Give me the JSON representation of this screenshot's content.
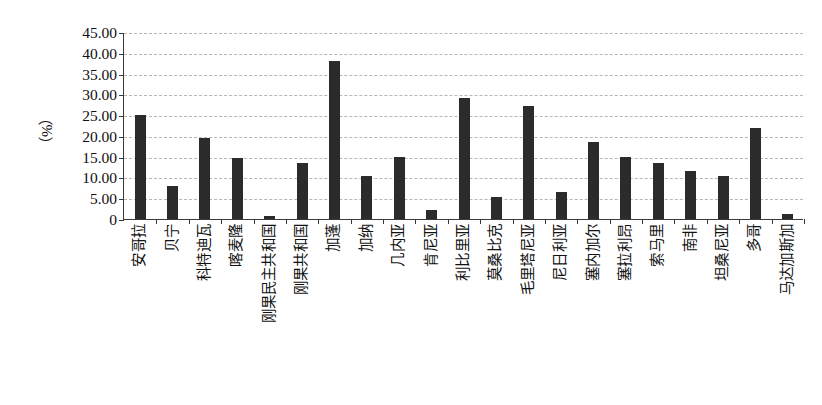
{
  "chart_data": {
    "type": "bar",
    "title": "",
    "subtitle": "",
    "xlabel": "",
    "ylabel": "（%）",
    "ylim": [
      0,
      45
    ],
    "ytick_values": [
      45,
      40,
      35,
      30,
      25,
      20,
      15,
      10,
      5,
      0
    ],
    "ytick_labels": [
      "45.00",
      "40.00",
      "35.00",
      "30.00",
      "25.00",
      "20.00",
      "15.00",
      "10.00",
      "5.00",
      "0"
    ],
    "grid": true,
    "grid_axis": "y",
    "grid_style": "dashed",
    "legend": false,
    "legend_position": "none",
    "bar_color": "#2b2b2b",
    "axis_color": "#3a3a3a",
    "gridline_color": "#b6b6b6",
    "background_color": "#ffffff",
    "categories": [
      "安哥拉",
      "贝宁",
      "科特迪瓦",
      "喀麦隆",
      "刚果民主共和国",
      "刚果共和国",
      "加蓬",
      "加纳",
      "几内亚",
      "肯尼亚",
      "利比里亚",
      "莫桑比克",
      "毛里塔尼亚",
      "尼日利亚",
      "塞内加尔",
      "塞拉利昂",
      "索马里",
      "南非",
      "坦桑尼亚",
      "多哥",
      "马达加斯加"
    ],
    "values": [
      25.0,
      8.0,
      19.6,
      14.7,
      0.8,
      13.5,
      38.0,
      10.3,
      14.9,
      2.2,
      29.2,
      5.3,
      27.2,
      6.6,
      18.6,
      14.9,
      13.6,
      11.6,
      10.3,
      21.8,
      1.3
    ]
  }
}
